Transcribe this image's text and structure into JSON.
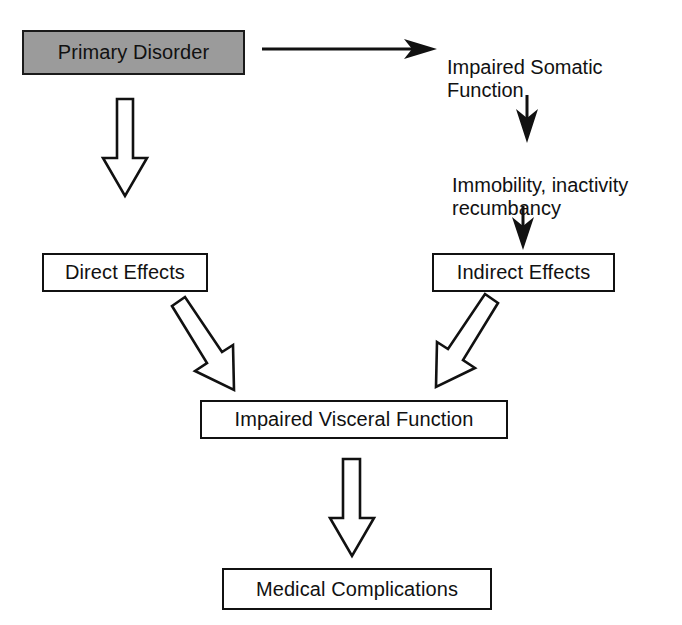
{
  "diagram": {
    "colors": {
      "stroke": "#111111",
      "background": "#ffffff",
      "shaded_fill": "#9b9b9b"
    },
    "nodes": {
      "primary_disorder": {
        "label": "Primary Disorder",
        "style": "shaded-box",
        "x": 22,
        "y": 30,
        "w": 223,
        "h": 45,
        "font_size": 20
      },
      "impaired_somatic_function": {
        "label": "Impaired Somatic\nFunction",
        "style": "plain-text",
        "x": 447,
        "y": 32,
        "w": 215,
        "h": 58,
        "font_size": 20
      },
      "immobility": {
        "label": "Immobility, inactivity\nrecumbancy",
        "style": "plain-text",
        "x": 452,
        "y": 150,
        "w": 220,
        "h": 58,
        "font_size": 20
      },
      "direct_effects": {
        "label": "Direct Effects",
        "style": "box",
        "x": 42,
        "y": 253,
        "w": 166,
        "h": 39,
        "font_size": 20
      },
      "indirect_effects": {
        "label": "Indirect Effects",
        "style": "box",
        "x": 432,
        "y": 253,
        "w": 183,
        "h": 39,
        "font_size": 20
      },
      "impaired_visceral_function": {
        "label": "Impaired Visceral Function",
        "style": "box",
        "x": 200,
        "y": 400,
        "w": 308,
        "h": 39,
        "font_size": 20
      },
      "medical_complications": {
        "label": "Medical Complications",
        "style": "box",
        "x": 222,
        "y": 568,
        "w": 270,
        "h": 42,
        "font_size": 20
      }
    },
    "edges": [
      {
        "name": "primary-disorder-to-impaired-somatic",
        "from": "primary_disorder",
        "to": "impaired_somatic_function",
        "style": "thin-solid-arrow",
        "direction": "right"
      },
      {
        "name": "primary-disorder-to-direct-effects",
        "from": "primary_disorder",
        "to": "direct_effects",
        "style": "hollow-block-arrow",
        "direction": "down"
      },
      {
        "name": "impaired-somatic-to-immobility",
        "from": "impaired_somatic_function",
        "to": "immobility",
        "style": "thin-solid-arrow",
        "direction": "down"
      },
      {
        "name": "immobility-to-indirect-effects",
        "from": "immobility",
        "to": "indirect_effects",
        "style": "thin-solid-arrow",
        "direction": "down"
      },
      {
        "name": "direct-effects-to-impaired-visceral",
        "from": "direct_effects",
        "to": "impaired_visceral_function",
        "style": "hollow-block-arrow",
        "direction": "down-right"
      },
      {
        "name": "indirect-effects-to-impaired-visceral",
        "from": "indirect_effects",
        "to": "impaired_visceral_function",
        "style": "hollow-block-arrow",
        "direction": "down-left"
      },
      {
        "name": "impaired-visceral-to-medical-complications",
        "from": "impaired_visceral_function",
        "to": "medical_complications",
        "style": "hollow-block-arrow",
        "direction": "down"
      }
    ]
  }
}
